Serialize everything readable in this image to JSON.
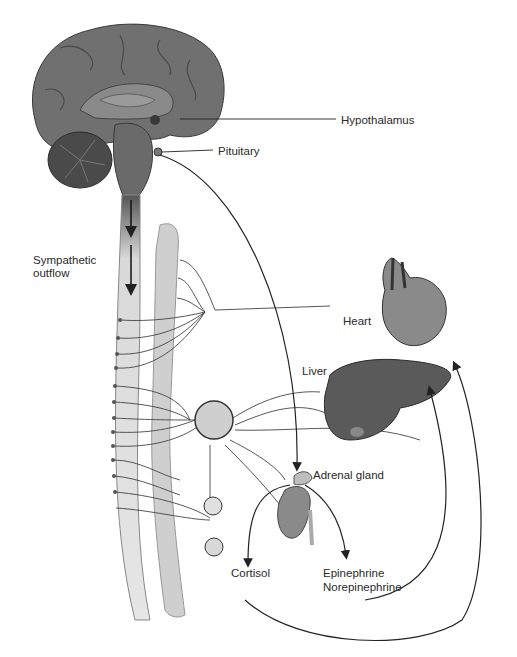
{
  "figure": {
    "type": "anatomical diagram"
  },
  "labels": {
    "hypothalamus": "Hypothalamus",
    "pituitary": "Pituitary",
    "sympathetic_outflow_line1": "Sympathetic",
    "sympathetic_outflow_line2": "outflow",
    "heart": "Heart",
    "liver": "Liver",
    "adrenal_gland": "Adrenal gland",
    "cortisol": "Cortisol",
    "epinephrine": "Epinephrine",
    "norepinephrine": "Norepinephrine"
  },
  "colors": {
    "brain": "#6e6e6e",
    "brain_dark": "#3e3e3e",
    "spinal_cord": "#d9d9d9",
    "ganglion_chain": "#cfcfcf",
    "organ": "#5a5a5a",
    "line": "#333333",
    "text": "#2a2a2a"
  }
}
